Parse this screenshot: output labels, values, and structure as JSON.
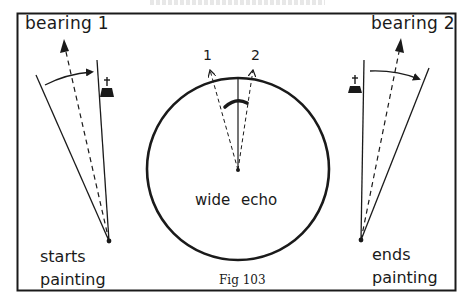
{
  "figure": {
    "caption": "Fig 103",
    "frame_color": "#1a1a1a"
  },
  "left_panel": {
    "bearing_label": "bearing 1",
    "status_line1": "starts",
    "status_line2": "painting",
    "icon": "church-icon"
  },
  "center_panel": {
    "echo_label": "wide echo",
    "ray_labels": [
      "1",
      "2"
    ],
    "element": "radar-scope-circle"
  },
  "right_panel": {
    "bearing_label": "bearing 2",
    "status_line1": "ends",
    "status_line2": "painting",
    "icon": "church-icon"
  }
}
